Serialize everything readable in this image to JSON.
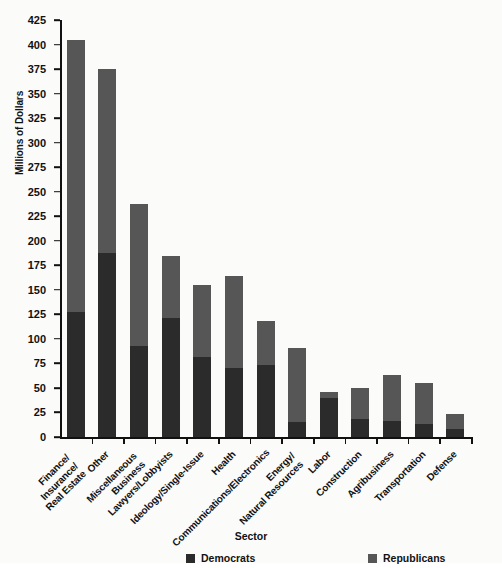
{
  "chart_data": {
    "type": "bar",
    "title": "",
    "subtitle": "",
    "xlabel": "Sector",
    "ylabel": "Millions of Dollars",
    "stacked": true,
    "grid": false,
    "legend_position": "bottom",
    "ylim": [
      0,
      425
    ],
    "ytick_step": 25,
    "yticks": [
      0,
      25,
      50,
      75,
      100,
      125,
      150,
      175,
      200,
      225,
      250,
      275,
      300,
      325,
      350,
      375,
      400,
      425
    ],
    "ytick_labels": [
      "0",
      "25",
      "50",
      "75",
      "100",
      "125",
      "150",
      "175",
      "200",
      "225",
      "250",
      "275",
      "300",
      "325",
      "350",
      "375",
      "400",
      "425"
    ],
    "categories": [
      "Finance/\nInsurance/\nReal Estate",
      "Other",
      "Miscellaneous\nBusiness",
      "Lawyers/Lobbyists",
      "Ideology/Single-Issue",
      "Health",
      "Communications/Electronics",
      "Energy/\nNatural Resources",
      "Labor",
      "Construction",
      "Agribusiness",
      "Transportation",
      "Defense"
    ],
    "series": [
      {
        "name": "Democrats",
        "color": "#2b2b2b",
        "values": [
          127,
          188,
          93,
          121,
          82,
          70,
          73,
          15,
          40,
          18,
          16,
          13,
          8
        ]
      },
      {
        "name": "Republicans",
        "color": "#565656",
        "values": [
          278,
          187,
          144,
          63,
          73,
          94,
          45,
          76,
          6,
          32,
          47,
          42,
          15
        ]
      }
    ],
    "totals": [
      405,
      375,
      237,
      184,
      155,
      164,
      118,
      91,
      46,
      50,
      63,
      55,
      23
    ]
  },
  "legend": {
    "items": [
      {
        "label": "Democrats",
        "color": "#2b2b2b"
      },
      {
        "label": "Republicans",
        "color": "#565656"
      }
    ]
  },
  "axis": {
    "y_title": "Millions of Dollars",
    "x_title": "Sector"
  }
}
